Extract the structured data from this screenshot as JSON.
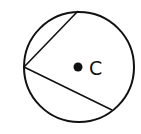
{
  "diagram": {
    "type": "circle-inscribed-angle",
    "circle": {
      "cx": 79,
      "cy": 67,
      "r": 55
    },
    "center_point": {
      "x": 78,
      "y": 67,
      "label": "C"
    },
    "vertex": {
      "x": 24,
      "y": 67
    },
    "chord_endpoints": [
      {
        "x": 78,
        "y": 11
      },
      {
        "x": 112,
        "y": 110
      }
    ],
    "stroke_color": "#111111"
  }
}
